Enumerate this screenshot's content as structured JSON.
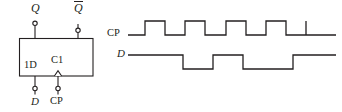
{
  "figure": {
    "type": "logic-symbol-and-timing-diagram",
    "stroke_color": "#231f20",
    "background": "#ffffff"
  },
  "flipflop": {
    "kind": "D flip-flop (IEEE/IEC rectangular symbol)",
    "box": {
      "x": 19,
      "y": 38,
      "width": 74,
      "height": 38
    },
    "labels": {
      "output_q": "Q",
      "output_qbar": "Q",
      "output_qbar_overbar": true,
      "input_data_internal": "1D",
      "input_clock_internal": "C1",
      "input_data_external": "D",
      "input_clock_external": "CP"
    },
    "pins": [
      {
        "name": "Q",
        "side": "top",
        "x": 35,
        "terminal_y": 22,
        "circle": true
      },
      {
        "name": "Qbar",
        "side": "top",
        "x": 78,
        "terminal_y": 29,
        "circle": true
      },
      {
        "name": "D",
        "side": "bottom",
        "x": 35,
        "terminal_y": 89,
        "circle": true
      },
      {
        "name": "CP",
        "side": "bottom",
        "x": 58,
        "terminal_y": 89,
        "circle": true,
        "dynamic_input": true
      }
    ]
  },
  "timing": {
    "signals": [
      {
        "name": "CP",
        "label": "CP",
        "italic": false,
        "high_y": 21,
        "low_y": 35,
        "start_x": 130,
        "end_x": 336,
        "start_level": "low",
        "transitions": [
          145,
          165,
          185,
          205,
          226,
          246,
          266,
          286,
          306
        ],
        "pulse_count": 4
      },
      {
        "name": "D",
        "label": "D",
        "italic": true,
        "high_y": 55,
        "low_y": 69,
        "start_x": 130,
        "end_x": 336,
        "start_level": "high",
        "transitions": [
          183,
          213,
          243,
          293
        ],
        "pulse_count": 2
      }
    ]
  }
}
